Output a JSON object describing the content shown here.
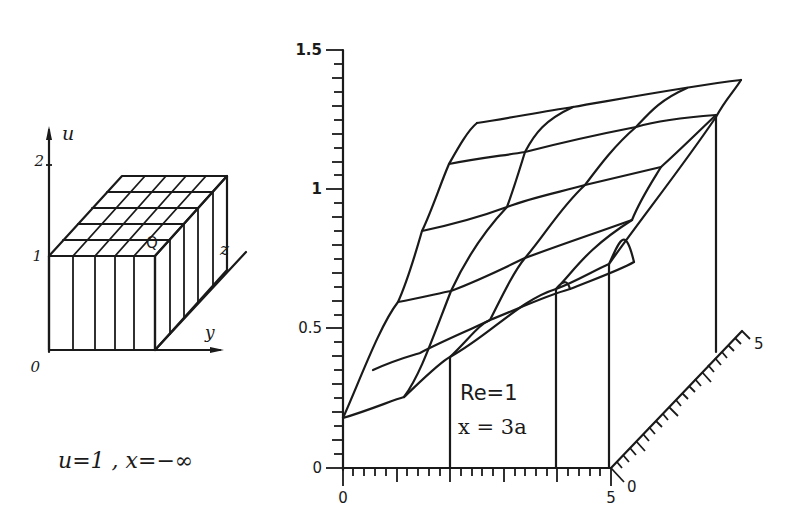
{
  "left_panel": {
    "axis_label_u": "u",
    "axis_label_y": "y",
    "axis_label_z": "z",
    "point_label": "Q",
    "u_ticks": [
      "0",
      "1",
      "2"
    ],
    "caption": "u=1 , x=−∞"
  },
  "right_panel": {
    "u_axis_ticks": [
      "0",
      "0.5",
      "1",
      "1.5"
    ],
    "y_axis_ticks": [
      "0",
      "5"
    ],
    "z_axis_ticks": [
      "0",
      "5"
    ],
    "annotation_re": "Re=1",
    "annotation_x": "x = 3a"
  },
  "colors": {
    "ink": "#1a1a1a",
    "paper": "#ffffff"
  }
}
